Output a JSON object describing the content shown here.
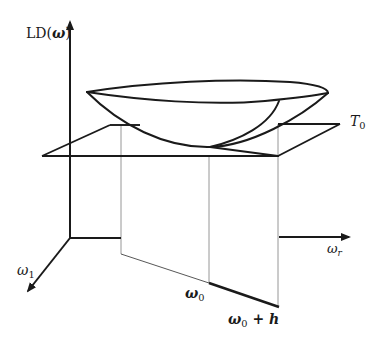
{
  "figure": {
    "colors": {
      "ink": "#1a1a1a",
      "thin": "#8a8a8a",
      "background": "#ffffff"
    },
    "labels": {
      "y_axis": {
        "prefix": "LD(",
        "symbol": "ω",
        "suffix": ")"
      },
      "plane": {
        "symbol": "T",
        "sub": "0"
      },
      "axis_omega1": {
        "symbol": "ω",
        "sub": "1"
      },
      "axis_omega_r": {
        "symbol": "ω",
        "sub": "r"
      },
      "point_omega0": {
        "symbol": "ω",
        "sub": "0"
      },
      "point_omega0_h": {
        "symbol": "ω",
        "sub": "0",
        "rest": " + h"
      }
    }
  }
}
